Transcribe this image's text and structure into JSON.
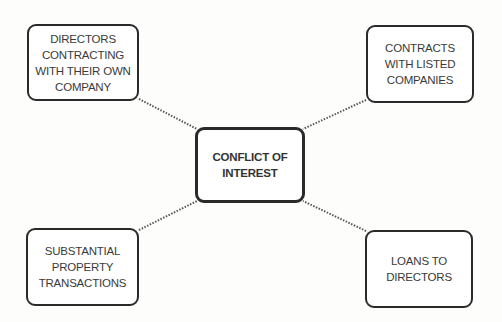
{
  "diagram": {
    "type": "mind-map",
    "center": {
      "label": "CONFLICT OF\nINTEREST"
    },
    "nodes": [
      {
        "id": "tl",
        "label": "DIRECTORS\nCONTRACTING\nWITH THEIR OWN\nCOMPANY"
      },
      {
        "id": "tr",
        "label": "CONTRACTS\nWITH LISTED\nCOMPANIES"
      },
      {
        "id": "bl",
        "label": "SUBSTANTIAL\nPROPERTY\nTRANSACTIONS"
      },
      {
        "id": "br",
        "label": "LOANS TO\nDIRECTORS"
      }
    ],
    "connector_style": "dotted",
    "colors": {
      "border": "#2a2a2a",
      "text": "#3a3a3a",
      "background": "#fdfdfc"
    }
  }
}
